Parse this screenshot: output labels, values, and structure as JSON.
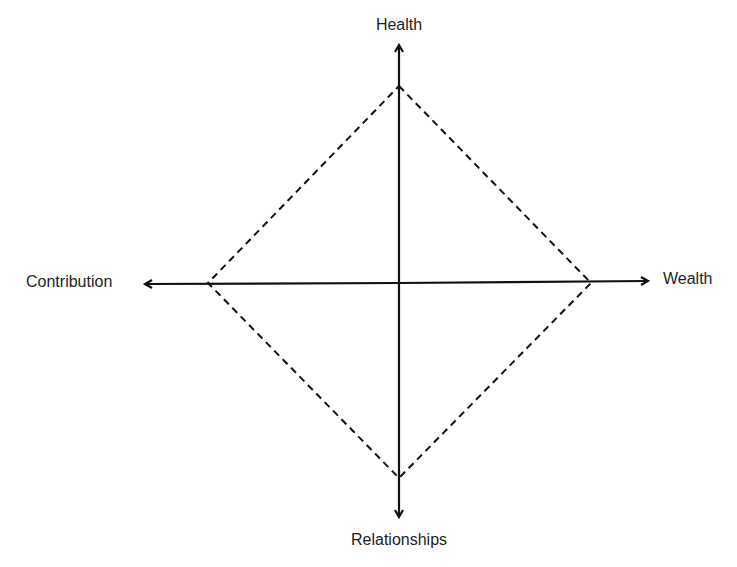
{
  "diagram": {
    "type": "four-axis balance diagram",
    "axes": {
      "top": {
        "label": "Health"
      },
      "bottom": {
        "label": "Relationships"
      },
      "left": {
        "label": "Contribution"
      },
      "right": {
        "label": "Wealth"
      }
    },
    "shape": {
      "kind": "diamond",
      "stroke_style": "dashed",
      "vertices": [
        "top",
        "right",
        "bottom",
        "left"
      ]
    },
    "colors": {
      "background": "#ffffff",
      "line": "#111111",
      "text": "#1e1e1e"
    }
  }
}
